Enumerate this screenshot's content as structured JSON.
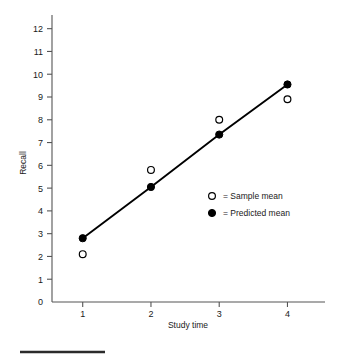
{
  "chart_data": {
    "type": "line",
    "title": "",
    "xlabel": "Study time",
    "ylabel": "Recall",
    "x": [
      1,
      2,
      3,
      4
    ],
    "xlim": [
      0.55,
      4.55
    ],
    "ylim": [
      0,
      12.6
    ],
    "xticks": [
      "1",
      "2",
      "3",
      "4"
    ],
    "yticks": [
      "0",
      "1",
      "2",
      "3",
      "4",
      "5",
      "6",
      "7",
      "8",
      "9",
      "10",
      "11",
      "12"
    ],
    "grid": false,
    "legend_position": "center-right",
    "series": [
      {
        "name": "Sample mean",
        "marker": "open-circle",
        "line": false,
        "color": "#000000",
        "values": [
          2.1,
          5.8,
          8.0,
          8.9
        ]
      },
      {
        "name": "Predicted mean",
        "marker": "filled-circle",
        "line": true,
        "color": "#000000",
        "values": [
          2.8,
          5.05,
          7.35,
          9.55
        ]
      }
    ],
    "legend": [
      {
        "marker": "open-circle",
        "text": "= Sample mean"
      },
      {
        "marker": "filled-circle",
        "text": "= Predicted mean"
      }
    ]
  },
  "figure": {
    "axis_color": "#555555",
    "ink_color": "#000000",
    "background": "#ffffff",
    "footer_rule": true
  }
}
